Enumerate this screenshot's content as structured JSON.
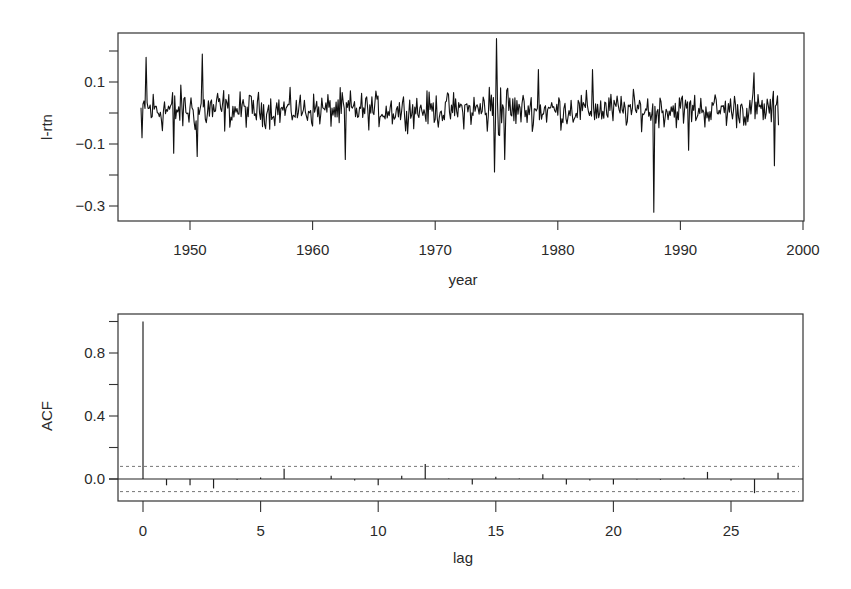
{
  "chart_data": [
    {
      "type": "line",
      "title": "",
      "xlabel": "year",
      "ylabel": "l-rtn",
      "xlim": [
        1944,
        2000
      ],
      "ylim": [
        -0.34,
        0.27
      ],
      "x_ticks": [
        1950,
        1960,
        1970,
        1980,
        1990,
        2000
      ],
      "x_tick_labels": [
        "1950",
        "1960",
        "1970",
        "1980",
        "1990",
        "2000"
      ],
      "y_ticks": [
        0.2,
        0.1,
        0.0,
        -0.1,
        -0.2,
        -0.3
      ],
      "y_tick_labels": [
        "",
        "0.1",
        "",
        "-0.1",
        "",
        "-0.3"
      ],
      "grid": false,
      "series": [
        {
          "name": "monthly log returns",
          "description": "Monthly log returns 1946-1998, mostly within [-0.15, 0.2]",
          "x_start": 1946.0,
          "x_end": 1998.0,
          "notable_points": [
            {
              "x": 1946.1,
              "y": -0.08
            },
            {
              "x": 1946.4,
              "y": 0.18
            },
            {
              "x": 1948.7,
              "y": -0.13
            },
            {
              "x": 1950.6,
              "y": -0.14
            },
            {
              "x": 1951.0,
              "y": 0.19
            },
            {
              "x": 1962.7,
              "y": -0.15
            },
            {
              "x": 1974.8,
              "y": -0.19
            },
            {
              "x": 1975.0,
              "y": 0.24
            },
            {
              "x": 1975.7,
              "y": -0.15
            },
            {
              "x": 1978.4,
              "y": 0.14
            },
            {
              "x": 1982.8,
              "y": 0.14
            },
            {
              "x": 1987.8,
              "y": -0.32
            },
            {
              "x": 1990.7,
              "y": -0.12
            },
            {
              "x": 1996.0,
              "y": 0.13
            },
            {
              "x": 1997.7,
              "y": -0.17
            }
          ]
        }
      ]
    },
    {
      "type": "bar",
      "title": "",
      "xlabel": "lag",
      "ylabel": "ACF",
      "xlim": [
        -1,
        28
      ],
      "ylim": [
        -0.15,
        1.05
      ],
      "x_ticks": [
        0,
        5,
        10,
        15,
        20,
        25
      ],
      "x_tick_labels": [
        "0",
        "5",
        "10",
        "15",
        "20",
        "25"
      ],
      "y_ticks": [
        1.0,
        0.8,
        0.6,
        0.4,
        0.2,
        0.0
      ],
      "y_tick_labels": [
        "",
        "0.8",
        "",
        "0.4",
        "",
        "0.0"
      ],
      "confidence_band": [
        -0.08,
        0.08
      ],
      "grid": false,
      "categories": [
        0,
        1,
        2,
        3,
        4,
        5,
        6,
        7,
        8,
        9,
        10,
        11,
        12,
        13,
        14,
        15,
        16,
        17,
        18,
        19,
        20,
        21,
        22,
        23,
        24,
        25,
        26,
        27
      ],
      "values": [
        1.0,
        -0.04,
        -0.04,
        -0.06,
        -0.005,
        0.01,
        0.065,
        0.0,
        0.02,
        -0.01,
        -0.04,
        0.02,
        0.095,
        0.003,
        -0.035,
        0.015,
        0.003,
        0.03,
        -0.035,
        -0.01,
        -0.035,
        -0.003,
        -0.005,
        0.008,
        0.045,
        -0.01,
        -0.09,
        0.04
      ]
    }
  ]
}
